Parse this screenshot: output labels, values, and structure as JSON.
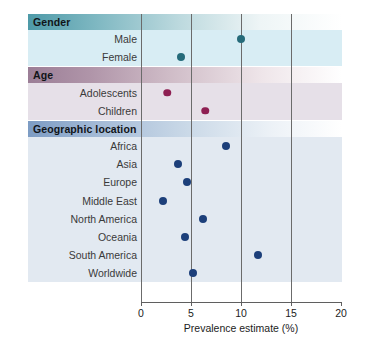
{
  "chart_data": {
    "type": "scatter",
    "title": "",
    "xlabel": "Prevalence estimate (%)",
    "ylabel": "",
    "xlim": [
      0,
      20
    ],
    "xticks": [
      0,
      5,
      10,
      15,
      20
    ],
    "xtick_labels": [
      "0",
      "5",
      "10",
      "15",
      "20"
    ],
    "gridlines_x": [
      5,
      10,
      15
    ],
    "grid": true,
    "legend": "none",
    "orientation": "horizontal",
    "sections": [
      {
        "header": "Gender",
        "header_color": "#4e9aa8",
        "band_color": "#d8edf4",
        "dot_color": "#256b7a",
        "rows": [
          {
            "label": "Male",
            "value": 10.0
          },
          {
            "label": "Female",
            "value": 4.0
          }
        ]
      },
      {
        "header": "Age",
        "header_color": "#9b7e96",
        "band_color": "#e6e0e8",
        "dot_color": "#8e1f52",
        "rows": [
          {
            "label": "Adolescents",
            "value": 2.6
          },
          {
            "label": "Children",
            "value": 6.4
          }
        ]
      },
      {
        "header": "Geographic location",
        "header_color": "#7d9cc4",
        "band_color": "#e2e9f1",
        "dot_color": "#1c3f7a",
        "rows": [
          {
            "label": "Africa",
            "value": 8.5
          },
          {
            "label": "Asia",
            "value": 3.7
          },
          {
            "label": "Europe",
            "value": 4.6
          },
          {
            "label": "Middle East",
            "value": 2.2
          },
          {
            "label": "North America",
            "value": 6.2
          },
          {
            "label": "Oceania",
            "value": 4.4
          },
          {
            "label": "South America",
            "value": 11.7
          },
          {
            "label": "Worldwide",
            "value": 5.2
          }
        ]
      }
    ]
  }
}
